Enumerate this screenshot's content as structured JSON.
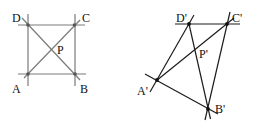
{
  "figure_left": {
    "description": "square with diagonals",
    "line_color": "#7a7a7a",
    "labels": {
      "A": "A",
      "B": "B",
      "C": "C",
      "D": "D",
      "P": "P"
    }
  },
  "figure_right": {
    "description": "projective image of square with diagonals",
    "line_color": "#1c1c1c",
    "labels": {
      "A": "A'",
      "B": "B'",
      "C": "C'",
      "D": "D'",
      "P": "P'"
    }
  }
}
